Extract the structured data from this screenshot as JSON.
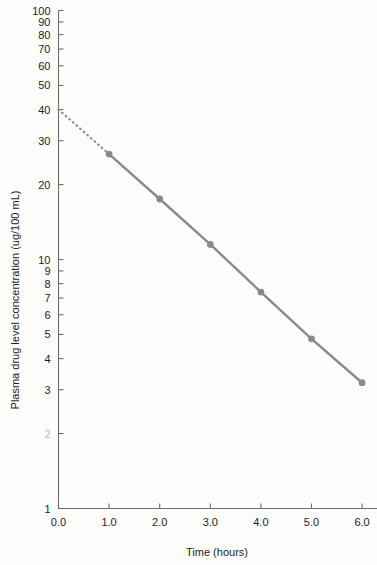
{
  "chart_data": {
    "type": "line",
    "title": "",
    "xlabel": "Time (hours)",
    "ylabel": "Plasma drug level concentration (ug/100 mL)",
    "x": [
      1.0,
      2.0,
      3.0,
      4.0,
      5.0,
      6.0
    ],
    "values": [
      26.5,
      17.5,
      11.5,
      7.4,
      4.8,
      3.2
    ],
    "series": [
      {
        "name": "Plasma drug level",
        "x": [
          1.0,
          2.0,
          3.0,
          4.0,
          5.0,
          6.0
        ],
        "values": [
          26.5,
          17.5,
          11.5,
          7.4,
          4.8,
          3.2
        ],
        "color": "#8a8a8a",
        "marker": "circle",
        "style": "solid"
      },
      {
        "name": "Extrapolation to intercept",
        "x": [
          0.0,
          1.0
        ],
        "values": [
          40.0,
          26.5
        ],
        "color": "#8a8a8a",
        "marker": "none",
        "style": "dotted"
      }
    ],
    "xlim": [
      0.0,
      6.3
    ],
    "ylim": [
      1,
      100
    ],
    "yscale": "log",
    "xscale": "linear",
    "grid": false,
    "legend": "none",
    "y_intercept": 40.0,
    "x_ticks": [
      "0.0",
      "1.0",
      "2.0",
      "3.0",
      "4.0",
      "5.0",
      "6.0"
    ],
    "x_tick_values": [
      0.0,
      1.0,
      2.0,
      3.0,
      4.0,
      5.0,
      6.0
    ],
    "y_ticks": [
      {
        "label": "100",
        "value": 100,
        "faded": false
      },
      {
        "label": "90",
        "value": 90,
        "faded": false
      },
      {
        "label": "80",
        "value": 80,
        "faded": false
      },
      {
        "label": "70",
        "value": 70,
        "faded": false
      },
      {
        "label": "60",
        "value": 60,
        "faded": false
      },
      {
        "label": "50",
        "value": 50,
        "faded": false
      },
      {
        "label": "40",
        "value": 40,
        "faded": false
      },
      {
        "label": "30",
        "value": 30,
        "faded": false
      },
      {
        "label": "20",
        "value": 20,
        "faded": false
      },
      {
        "label": "10",
        "value": 10,
        "faded": false
      },
      {
        "label": "9",
        "value": 9,
        "faded": false
      },
      {
        "label": "8",
        "value": 8,
        "faded": false
      },
      {
        "label": "7",
        "value": 7,
        "faded": false
      },
      {
        "label": "6",
        "value": 6,
        "faded": false
      },
      {
        "label": "5",
        "value": 5,
        "faded": false
      },
      {
        "label": "4",
        "value": 4,
        "faded": false
      },
      {
        "label": "3",
        "value": 3,
        "faded": false
      },
      {
        "label": "2",
        "value": 2,
        "faded": true
      },
      {
        "label": "1",
        "value": 1,
        "faded": false
      }
    ],
    "colors": {
      "line": "#8a8a8a",
      "marker": "#8a8a8a",
      "axis": "#6e6e6e",
      "text": "#1c1c1c",
      "background": "#fdfdfc"
    }
  }
}
